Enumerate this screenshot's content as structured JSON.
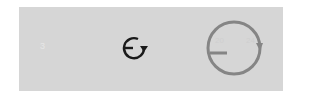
{
  "panel": {
    "background": "#d6d6d6",
    "left_label": "3",
    "small_icon": {
      "name": "rotate-clockwise-icon",
      "color": "#1a1a1a"
    },
    "large_icon": {
      "name": "rotate-clockwise-icon",
      "color": "#808080",
      "inner_label_left": "20",
      "inner_label_right": "24"
    }
  }
}
